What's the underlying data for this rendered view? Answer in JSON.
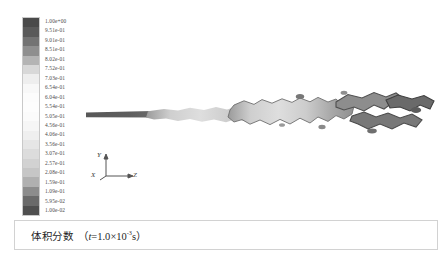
{
  "figure": {
    "title_caption": "体积分数",
    "caption_paren_open": "（",
    "caption_paren_close": "）",
    "time_var": "t",
    "time_eq": "=1.0",
    "time_times": "×10",
    "time_exponent": "-3",
    "time_unit": "s",
    "background_color": "#ffffff"
  },
  "legend": {
    "name": "volume-fraction-colorbar",
    "orientation": "vertical",
    "min": "1.00e-02",
    "max": "1.00e+00",
    "labels": [
      "1.00e+00",
      "9.51e-01",
      "9.01e-01",
      "8.51e-01",
      "8.02e-01",
      "7.52e-01",
      "7.03e-01",
      "6.54e-01",
      "6.04e-01",
      "5.54e-01",
      "5.05e-01",
      "4.56e-01",
      "4.06e-01",
      "3.56e-01",
      "3.07e-01",
      "2.57e-01",
      "2.08e-01",
      "1.59e-01",
      "1.09e-01",
      "5.95e-02",
      "1.00e-02"
    ],
    "swatch_colors": [
      "#4a4a4a",
      "#5a5a5a",
      "#737373",
      "#8f8f8f",
      "#b4b4b4",
      "#d8d8d8",
      "#eeeeee",
      "#f8f8f8",
      "#fcfcfc",
      "#fdfdfd",
      "#fbfbfb",
      "#f6f6f6",
      "#efefef",
      "#e6e6e6",
      "#dcdcdc",
      "#d2d2d2",
      "#c6c6c6",
      "#b0b0b0",
      "#8c8c8c",
      "#6a6a6a",
      "#4f4f4f"
    ]
  },
  "axis_triad": {
    "x_label": "X",
    "y_label": "Y",
    "z_label": "Z",
    "line_color": "#555555"
  },
  "chart_data": {
    "type": "heatmap",
    "xlabel": "Z",
    "ylabel": "Y",
    "colorbar_label": "volume fraction",
    "colormap": "grayscale",
    "legend_position": "left",
    "grid": false,
    "zlim": [
      0.01,
      1.0
    ],
    "tick_labels": [
      "1.00e+00",
      "9.51e-01",
      "9.01e-01",
      "8.51e-01",
      "8.02e-01",
      "7.52e-01",
      "7.03e-01",
      "6.54e-01",
      "6.04e-01",
      "5.54e-01",
      "5.05e-01",
      "4.56e-01",
      "4.06e-01",
      "3.56e-01",
      "3.07e-01",
      "2.57e-01",
      "2.08e-01",
      "1.59e-01",
      "1.09e-01",
      "5.95e-02",
      "1.00e-02"
    ],
    "core_extent_fraction": 0.22,
    "breakup_start_fraction": 0.2,
    "series": [
      {
        "name": "liquid-core",
        "values": [
          1.0,
          1.0,
          1.0,
          0.98,
          0.95,
          0.9
        ]
      },
      {
        "name": "dispersed-plume",
        "values": [
          0.6,
          0.45,
          0.35,
          0.3,
          0.35,
          0.5,
          0.65,
          0.8,
          0.9
        ]
      }
    ]
  }
}
